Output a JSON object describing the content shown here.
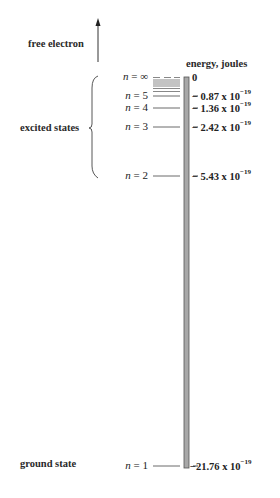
{
  "diagram": {
    "title_axis": "energy, joules",
    "free_electron_label": "free electron",
    "excited_states_label": "excited states",
    "ground_state_label": "ground state",
    "colors": {
      "bar": "#a8a8a8",
      "bar_edge": "#555555",
      "lines": "#444444"
    },
    "levels": [
      {
        "n_prefix": "n",
        "n_value": "∞",
        "energy": "0",
        "energy_exp": ""
      },
      {
        "n_prefix": "n",
        "n_value": "5",
        "energy": "− 0.87 x 10",
        "energy_exp": "−19"
      },
      {
        "n_prefix": "n",
        "n_value": "4",
        "energy": "− 1.36 x 10",
        "energy_exp": "−19"
      },
      {
        "n_prefix": "n",
        "n_value": "3",
        "energy": "− 2.42 x 10",
        "energy_exp": "−19"
      },
      {
        "n_prefix": "n",
        "n_value": "2",
        "energy": "− 5.43 x 10",
        "energy_exp": "−19"
      },
      {
        "n_prefix": "n",
        "n_value": "1",
        "energy": "−21.76 x 10",
        "energy_exp": "−19"
      }
    ]
  }
}
